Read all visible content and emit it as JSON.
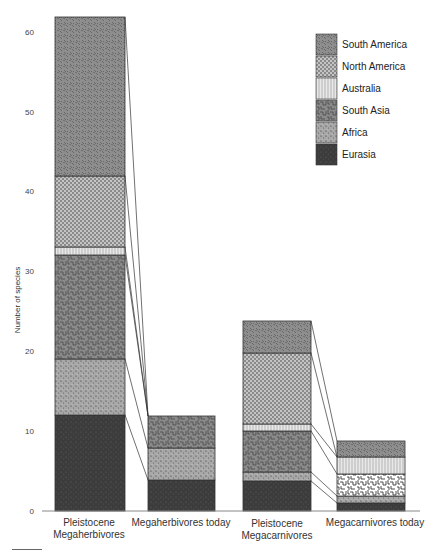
{
  "chart_data": {
    "type": "bar",
    "stacked": true,
    "title": "",
    "xlabel": "",
    "ylabel": "Number of species",
    "ylim": [
      0,
      62
    ],
    "yticks": [
      0,
      10,
      20,
      30,
      40,
      50,
      60
    ],
    "grid": false,
    "legend_position": "top-right",
    "categories": [
      "Pleistocene Megaherbivores",
      "Megaherbivores today",
      "Pleistocene Megacarnivores",
      "Megacarnivores today"
    ],
    "category_lines": [
      [
        "Pleistocene",
        "Megaherbivores"
      ],
      [
        "Megaherbivores today"
      ],
      [
        "Pleistocene",
        "Megacarnivores"
      ],
      [
        "Megacarnivores today"
      ]
    ],
    "series": [
      {
        "name": "Eurasia",
        "values": [
          12,
          4,
          4,
          1
        ],
        "pattern": "dark-stipple",
        "color": "#3a3a3a"
      },
      {
        "name": "Africa",
        "values": [
          7,
          4,
          1,
          1
        ],
        "pattern": "light-stipple",
        "color": "#9a9a9a"
      },
      {
        "name": "South Asia",
        "values": [
          13,
          4,
          5,
          2.75
        ],
        "pattern": "labyrinth",
        "color": "#7e7e7e"
      },
      {
        "name": "Australia",
        "values": [
          1,
          0,
          1,
          2
        ],
        "pattern": "lines",
        "color": "#dcdcdc"
      },
      {
        "name": "North America",
        "values": [
          9,
          0,
          9,
          0
        ],
        "pattern": "checker",
        "color": "#b0b0b0"
      },
      {
        "name": "South America",
        "values": [
          20,
          0,
          4,
          2
        ],
        "pattern": "dashes",
        "color": "#8c8c8c"
      }
    ],
    "legend_order": [
      "South America",
      "North America",
      "Australia",
      "South Asia",
      "Africa",
      "Eurasia"
    ],
    "connector_lines": true
  }
}
